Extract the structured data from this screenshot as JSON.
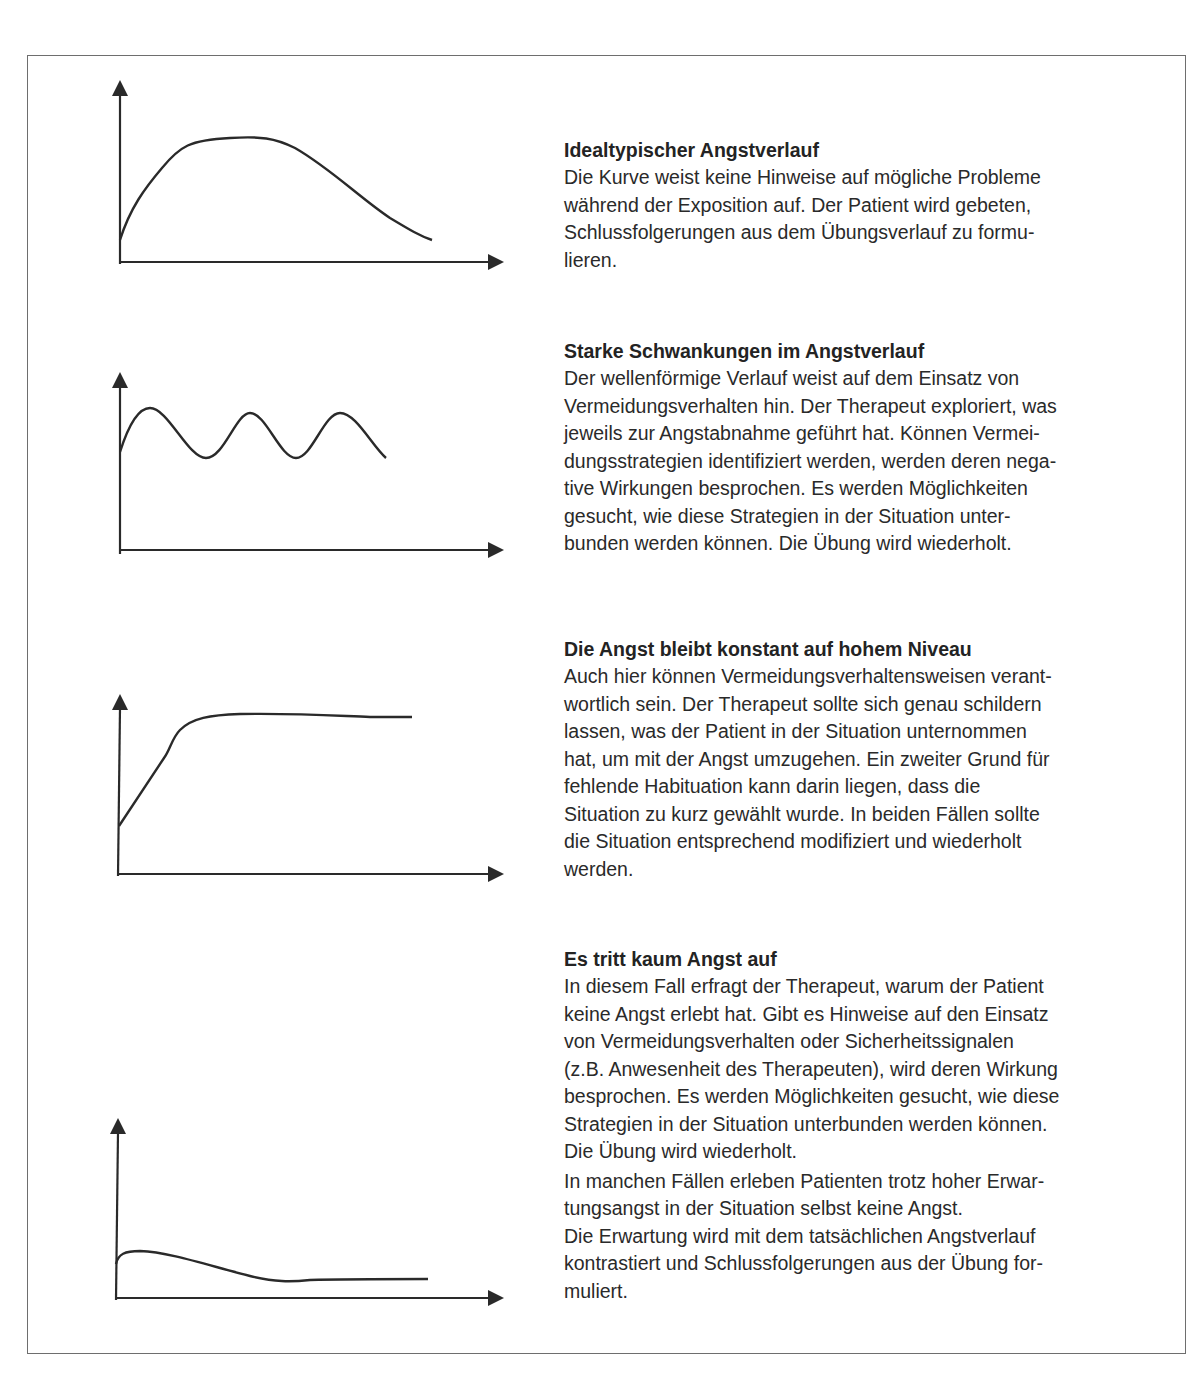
{
  "sections": [
    {
      "title": "Idealtypischer Angstverlauf",
      "paragraphs": [
        [
          "Die Kurve weist keine Hinweise auf mögliche Probleme",
          "während der Exposition auf. Der Patient wird gebeten,",
          "Schlussfolgerungen aus dem Übungsverlauf zu formu-",
          "lieren."
        ]
      ]
    },
    {
      "title": "Starke Schwankungen im Angstverlauf",
      "paragraphs": [
        [
          "Der wellenförmige Verlauf weist auf dem Einsatz von",
          "Vermeidungsverhalten hin. Der Therapeut exploriert, was",
          "jeweils zur Angstabnahme geführt hat. Können Vermei-",
          "dungsstrategien identifiziert werden, werden deren nega-",
          "tive Wirkungen besprochen. Es werden Möglichkeiten",
          "gesucht, wie diese Strategien in der Situation unter-",
          "bunden werden können. Die Übung wird wiederholt."
        ]
      ]
    },
    {
      "title": "Die Angst bleibt konstant auf hohem Niveau",
      "paragraphs": [
        [
          "Auch hier können Vermeidungsverhaltensweisen verant-",
          "wortlich sein. Der Therapeut sollte sich genau schildern",
          "lassen, was der Patient in der Situation unternommen",
          "hat, um mit der Angst umzugehen. Ein zweiter Grund für",
          "fehlende Habituation kann darin liegen, dass die",
          "Situation zu kurz gewählt wurde. In beiden Fällen sollte",
          "die Situation entsprechend modifiziert und wiederholt",
          "werden."
        ]
      ]
    },
    {
      "title": "Es tritt kaum Angst auf",
      "paragraphs": [
        [
          "In diesem Fall erfragt der Therapeut, warum der Patient",
          "keine Angst erlebt hat. Gibt es Hinweise auf den Einsatz",
          "von Vermeidungsverhalten oder Sicherheitssignalen",
          "(z.B. Anwesenheit des Therapeuten), wird deren Wirkung",
          "besprochen. Es werden Möglichkeiten gesucht, wie diese",
          "Strategien in der Situation unterbunden werden können.",
          "Die Übung wird wiederholt."
        ],
        [
          "In manchen Fällen erleben Patienten trotz hoher Erwar-",
          "tungsangst in der Situation selbst keine Angst.",
          "Die Erwartung wird mit dem tatsächlichen Angstverlauf",
          "kontrastiert und Schlussfolgerungen aus der Übung for-",
          "muliert."
        ]
      ]
    }
  ],
  "graphs": [
    {
      "name": "idealtypisch",
      "curve": "rise-peak-decline",
      "axes": [
        "y-arrow-up",
        "x-arrow-right"
      ]
    },
    {
      "name": "schwankungen",
      "curve": "wave-oscillation",
      "axes": [
        "y-arrow-up",
        "x-arrow-right"
      ]
    },
    {
      "name": "konstant-hoch",
      "curve": "rise-then-plateau-high",
      "axes": [
        "y-arrow-up",
        "x-arrow-right"
      ]
    },
    {
      "name": "kaum-angst",
      "curve": "low-flat",
      "axes": [
        "y-arrow-up",
        "x-arrow-right"
      ]
    }
  ],
  "colors": {
    "ink": "#2a2a2a",
    "frame": "#6e6e6e",
    "background": "#ffffff"
  }
}
